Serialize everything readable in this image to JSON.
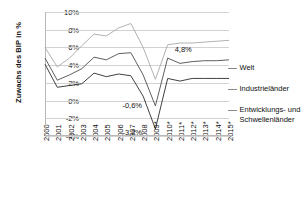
{
  "chart_data": {
    "type": "line",
    "title": "",
    "xlabel": "",
    "ylabel": "Zuwachs des BIP in %",
    "ylim": [
      -4,
      10
    ],
    "yticks": [
      "10%",
      "8%",
      "6%",
      "4%",
      "2%",
      "0%",
      "-2%",
      "-4%"
    ],
    "ytick_values": [
      10,
      8,
      6,
      4,
      2,
      0,
      -2,
      -4
    ],
    "grid": true,
    "legend_position": "right",
    "categories": [
      "2000",
      "2001",
      "2002",
      "2003",
      "2004",
      "2005",
      "2006",
      "2007",
      "2008",
      "2009*",
      "2010*",
      "2011*",
      "2012*",
      "2013*",
      "2014*",
      "2015*"
    ],
    "series": [
      {
        "name": "Entwicklungs- und Schwellenländer",
        "color": "#a8a8a8",
        "values": [
          6.0,
          3.8,
          4.8,
          6.2,
          7.5,
          7.3,
          8.2,
          8.7,
          6.0,
          2.4,
          6.3,
          6.5,
          6.5,
          6.6,
          6.7,
          6.8
        ]
      },
      {
        "name": "Welt",
        "color": "#4d4d4d",
        "values": [
          4.8,
          2.3,
          2.9,
          3.6,
          4.9,
          4.6,
          5.3,
          5.4,
          2.9,
          -0.6,
          4.8,
          4.2,
          4.4,
          4.5,
          4.5,
          4.6
        ]
      },
      {
        "name": "Industrieländer",
        "color": "#2b2b2b",
        "values": [
          4.1,
          1.5,
          1.7,
          1.9,
          3.1,
          2.7,
          3.0,
          2.8,
          0.5,
          -3.2,
          2.5,
          2.2,
          2.5,
          2.5,
          2.5,
          2.5
        ]
      }
    ],
    "annotations": [
      {
        "label": "4,8%",
        "x": "2010*",
        "y": 4.8
      },
      {
        "label": "-0,6%",
        "x": "2009*",
        "y": -0.6
      },
      {
        "label": "-3,2%",
        "x": "2009*",
        "y": -3.2
      }
    ]
  },
  "legend": {
    "items": [
      {
        "label": "Welt"
      },
      {
        "label": "Industrieländer"
      },
      {
        "label": "Entwicklungs- und",
        "label2": "Schwellenländer"
      }
    ]
  }
}
